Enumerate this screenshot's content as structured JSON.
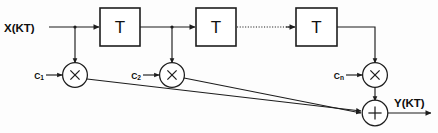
{
  "diagram": {
    "background_color": "#fdfdfd",
    "line_color": "#1d1d1d",
    "input": {
      "label": "X(KT)",
      "name": "input-signal-label"
    },
    "output": {
      "label": "Y(KT)",
      "name": "output-signal-label"
    },
    "delay_blocks": [
      {
        "label": "T",
        "name": "delay-block-1"
      },
      {
        "label": "T",
        "name": "delay-block-2"
      },
      {
        "label": "T",
        "name": "delay-block-3"
      }
    ],
    "multipliers": [
      {
        "glyph": "X",
        "coefficient": "C",
        "subscript": "1",
        "name": "multiplier-1"
      },
      {
        "glyph": "X",
        "coefficient": "C",
        "subscript": "2",
        "name": "multiplier-2"
      },
      {
        "glyph": "X",
        "coefficient": "C",
        "subscript": "n",
        "name": "multiplier-n"
      }
    ],
    "summer": {
      "glyph": "+",
      "name": "summing-junction"
    },
    "ellipsis_connection": {
      "style": "dotted",
      "note": "continuation between delay stages"
    }
  }
}
